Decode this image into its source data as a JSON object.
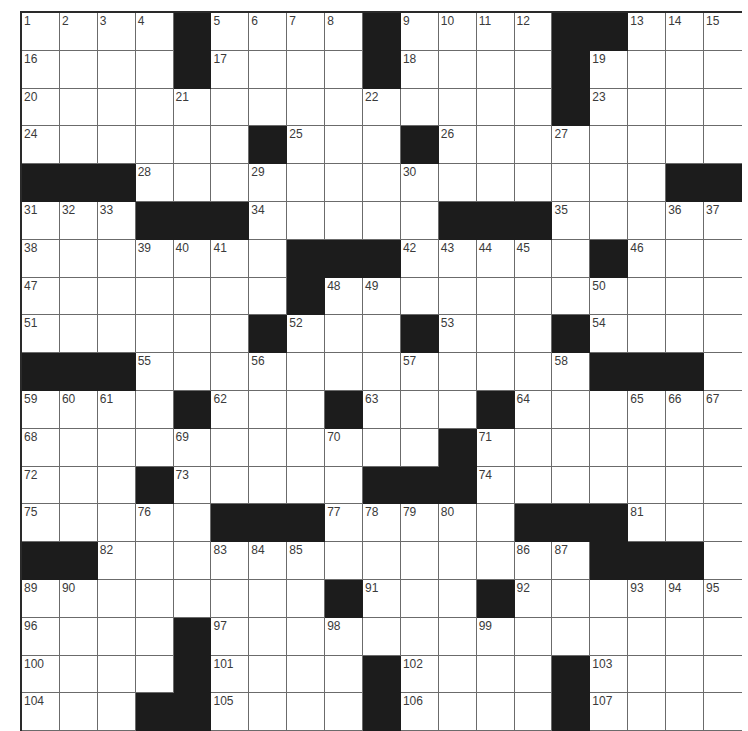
{
  "puzzle": {
    "rows": 19,
    "cols": 19,
    "colors": {
      "block": "#1c1c1c",
      "gridline": "#6b6b6b",
      "number": "#3a3a3a",
      "background": "#ffffff"
    },
    "layout": [
      "....#....#....##...",
      "....#....#....#....",
      "..............#....",
      "......#...#........",
      "###..............##",
      "...###.....###.....",
      ".......###.....#...",
      ".......#...........",
      "......#...#...#....",
      "###............###.",
      "....#...#...#......",
      "...........#.......",
      "...#.....###.......",
      ".....###.....###...",
      "##.............###.",
      "........#...#......",
      "....#..............",
      "....#....#....#....",
      "...##....#....#...."
    ],
    "numbers": [
      {
        "r": 0,
        "c": 0,
        "n": "1"
      },
      {
        "r": 0,
        "c": 1,
        "n": "2"
      },
      {
        "r": 0,
        "c": 2,
        "n": "3"
      },
      {
        "r": 0,
        "c": 3,
        "n": "4"
      },
      {
        "r": 0,
        "c": 5,
        "n": "5"
      },
      {
        "r": 0,
        "c": 6,
        "n": "6"
      },
      {
        "r": 0,
        "c": 7,
        "n": "7"
      },
      {
        "r": 0,
        "c": 8,
        "n": "8"
      },
      {
        "r": 0,
        "c": 10,
        "n": "9"
      },
      {
        "r": 0,
        "c": 11,
        "n": "10"
      },
      {
        "r": 0,
        "c": 12,
        "n": "11"
      },
      {
        "r": 0,
        "c": 13,
        "n": "12"
      },
      {
        "r": 0,
        "c": 16,
        "n": "13"
      },
      {
        "r": 0,
        "c": 17,
        "n": "14"
      },
      {
        "r": 0,
        "c": 18,
        "n": "15"
      },
      {
        "r": 1,
        "c": 0,
        "n": "16"
      },
      {
        "r": 1,
        "c": 5,
        "n": "17"
      },
      {
        "r": 1,
        "c": 10,
        "n": "18"
      },
      {
        "r": 1,
        "c": 15,
        "n": "19"
      },
      {
        "r": 2,
        "c": 0,
        "n": "20"
      },
      {
        "r": 2,
        "c": 4,
        "n": "21"
      },
      {
        "r": 2,
        "c": 9,
        "n": "22"
      },
      {
        "r": 2,
        "c": 15,
        "n": "23"
      },
      {
        "r": 3,
        "c": 0,
        "n": "24"
      },
      {
        "r": 3,
        "c": 7,
        "n": "25"
      },
      {
        "r": 3,
        "c": 11,
        "n": "26"
      },
      {
        "r": 3,
        "c": 14,
        "n": "27"
      },
      {
        "r": 4,
        "c": 3,
        "n": "28"
      },
      {
        "r": 4,
        "c": 6,
        "n": "29"
      },
      {
        "r": 4,
        "c": 10,
        "n": "30"
      },
      {
        "r": 5,
        "c": 0,
        "n": "31"
      },
      {
        "r": 5,
        "c": 1,
        "n": "32"
      },
      {
        "r": 5,
        "c": 2,
        "n": "33"
      },
      {
        "r": 5,
        "c": 6,
        "n": "34"
      },
      {
        "r": 5,
        "c": 14,
        "n": "35"
      },
      {
        "r": 5,
        "c": 17,
        "n": "36"
      },
      {
        "r": 5,
        "c": 18,
        "n": "37"
      },
      {
        "r": 6,
        "c": 0,
        "n": "38"
      },
      {
        "r": 6,
        "c": 3,
        "n": "39"
      },
      {
        "r": 6,
        "c": 4,
        "n": "40"
      },
      {
        "r": 6,
        "c": 5,
        "n": "41"
      },
      {
        "r": 6,
        "c": 10,
        "n": "42"
      },
      {
        "r": 6,
        "c": 11,
        "n": "43"
      },
      {
        "r": 6,
        "c": 12,
        "n": "44"
      },
      {
        "r": 6,
        "c": 13,
        "n": "45"
      },
      {
        "r": 6,
        "c": 16,
        "n": "46"
      },
      {
        "r": 7,
        "c": 0,
        "n": "47"
      },
      {
        "r": 7,
        "c": 8,
        "n": "48"
      },
      {
        "r": 7,
        "c": 9,
        "n": "49"
      },
      {
        "r": 7,
        "c": 15,
        "n": "50"
      },
      {
        "r": 8,
        "c": 0,
        "n": "51"
      },
      {
        "r": 8,
        "c": 7,
        "n": "52"
      },
      {
        "r": 8,
        "c": 11,
        "n": "53"
      },
      {
        "r": 8,
        "c": 15,
        "n": "54"
      },
      {
        "r": 9,
        "c": 3,
        "n": "55"
      },
      {
        "r": 9,
        "c": 6,
        "n": "56"
      },
      {
        "r": 9,
        "c": 10,
        "n": "57"
      },
      {
        "r": 9,
        "c": 14,
        "n": "58"
      },
      {
        "r": 10,
        "c": 0,
        "n": "59"
      },
      {
        "r": 10,
        "c": 1,
        "n": "60"
      },
      {
        "r": 10,
        "c": 2,
        "n": "61"
      },
      {
        "r": 10,
        "c": 5,
        "n": "62"
      },
      {
        "r": 10,
        "c": 9,
        "n": "63"
      },
      {
        "r": 10,
        "c": 13,
        "n": "64"
      },
      {
        "r": 10,
        "c": 16,
        "n": "65"
      },
      {
        "r": 10,
        "c": 17,
        "n": "66"
      },
      {
        "r": 10,
        "c": 18,
        "n": "67"
      },
      {
        "r": 11,
        "c": 0,
        "n": "68"
      },
      {
        "r": 11,
        "c": 4,
        "n": "69"
      },
      {
        "r": 11,
        "c": 8,
        "n": "70"
      },
      {
        "r": 11,
        "c": 12,
        "n": "71"
      },
      {
        "r": 12,
        "c": 0,
        "n": "72"
      },
      {
        "r": 12,
        "c": 4,
        "n": "73"
      },
      {
        "r": 12,
        "c": 12,
        "n": "74"
      },
      {
        "r": 13,
        "c": 0,
        "n": "75"
      },
      {
        "r": 13,
        "c": 3,
        "n": "76"
      },
      {
        "r": 13,
        "c": 8,
        "n": "77"
      },
      {
        "r": 13,
        "c": 9,
        "n": "78"
      },
      {
        "r": 13,
        "c": 10,
        "n": "79"
      },
      {
        "r": 13,
        "c": 11,
        "n": "80"
      },
      {
        "r": 13,
        "c": 16,
        "n": "81"
      },
      {
        "r": 14,
        "c": 2,
        "n": "82"
      },
      {
        "r": 14,
        "c": 5,
        "n": "83"
      },
      {
        "r": 14,
        "c": 6,
        "n": "84"
      },
      {
        "r": 14,
        "c": 7,
        "n": "85"
      },
      {
        "r": 14,
        "c": 13,
        "n": "86"
      },
      {
        "r": 14,
        "c": 14,
        "n": "87"
      },
      {
        "r": 14,
        "c": 15,
        "n": "88"
      },
      {
        "r": 15,
        "c": 0,
        "n": "89"
      },
      {
        "r": 15,
        "c": 1,
        "n": "90"
      },
      {
        "r": 15,
        "c": 9,
        "n": "91"
      },
      {
        "r": 15,
        "c": 13,
        "n": "92"
      },
      {
        "r": 15,
        "c": 16,
        "n": "93"
      },
      {
        "r": 15,
        "c": 17,
        "n": "94"
      },
      {
        "r": 15,
        "c": 18,
        "n": "95"
      },
      {
        "r": 16,
        "c": 0,
        "n": "96"
      },
      {
        "r": 16,
        "c": 5,
        "n": "97"
      },
      {
        "r": 16,
        "c": 8,
        "n": "98"
      },
      {
        "r": 16,
        "c": 12,
        "n": "99"
      },
      {
        "r": 17,
        "c": 0,
        "n": "100"
      },
      {
        "r": 17,
        "c": 5,
        "n": "101"
      },
      {
        "r": 17,
        "c": 10,
        "n": "102"
      },
      {
        "r": 17,
        "c": 15,
        "n": "103"
      },
      {
        "r": 18,
        "c": 0,
        "n": "104"
      },
      {
        "r": 18,
        "c": 5,
        "n": "105"
      },
      {
        "r": 18,
        "c": 10,
        "n": "106"
      },
      {
        "r": 18,
        "c": 15,
        "n": "107"
      }
    ]
  }
}
